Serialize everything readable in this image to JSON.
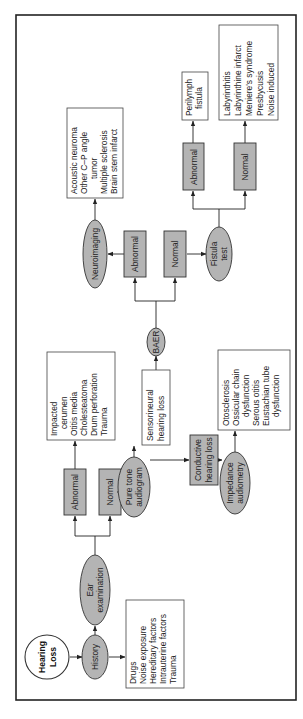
{
  "diagram": {
    "orientation": "rotated-90-ccw",
    "colors": {
      "node_fill": "#b4b4b4",
      "box_fill": "#ffffff",
      "stroke": "#222222"
    },
    "start": {
      "label": [
        "Hearing",
        "Loss"
      ]
    },
    "history": {
      "label": "History",
      "factors": [
        "Drugs",
        "Noise exposure",
        "Hereditary factors",
        "Intrauterine factors",
        "Trauma"
      ]
    },
    "ear_exam": {
      "label": [
        "Ear",
        "examination"
      ],
      "abnormal": "Abnormal",
      "normal": "Normal",
      "abnormal_causes": [
        "Impacted",
        "cerumen",
        "Otitis media",
        "Cholesteatoma",
        "Drum perforation",
        "Trauma"
      ]
    },
    "pure_tone": {
      "label": [
        "Pure tone",
        "audiogram"
      ],
      "sensorineural": [
        "Sensorineural",
        "hearing loss"
      ],
      "conductive": [
        "Conductive",
        "hearing loss"
      ]
    },
    "impedance": {
      "label": [
        "Impedance",
        "audiometry"
      ],
      "causes": [
        "Otosclerosis",
        "Ossicular chain",
        "dysfunction",
        "Serous otitis",
        "Eustachian tube",
        "dysfunction"
      ]
    },
    "baer": {
      "label": "BAER",
      "abnormal": "Abnormal",
      "normal": "Normal"
    },
    "neuroimaging": {
      "label": "Neuroimaging",
      "causes": [
        "Acoustic neuroma",
        "Other C–P angle",
        "tumor",
        "Multiple sclerosis",
        "Brain stem infarct"
      ]
    },
    "fistula": {
      "label": [
        "Fistula",
        "test"
      ],
      "abnormal": "Abnormal",
      "normal": "Normal",
      "abnormal_result": [
        "Perilymph",
        "fistula"
      ],
      "normal_causes": [
        "Labyrinthitis",
        "Labyrinthine infarct",
        "Meniere's syndrome",
        "Presbycusis",
        "Noise induced"
      ]
    }
  }
}
